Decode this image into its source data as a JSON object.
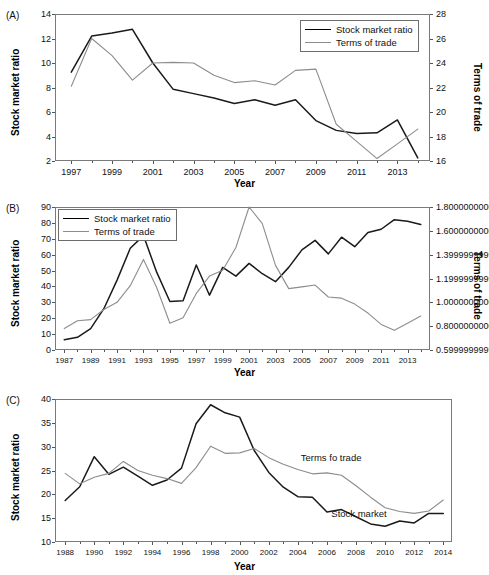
{
  "figure": {
    "panels": [
      {
        "tag": "(A)"
      },
      {
        "tag": "(B)"
      },
      {
        "tag": "(C)"
      }
    ]
  },
  "labels": {
    "stock_market_ratio": "Stock market ratio",
    "terms_of_trade": "Terms of trade",
    "terms_fo_trade": "Terms fo trade",
    "stock_market": "Stock market",
    "year": "Year"
  },
  "colors": {
    "stock_line": "#1a1a1a",
    "terms_line": "#8d8d8d",
    "axis": "#7a7a7a",
    "text": "#111111"
  },
  "chart_data": [
    {
      "type": "line",
      "panel": "A",
      "title": "",
      "xlabel": "Year",
      "ylabel": "Stock market ratio",
      "y2label": "Terms of trade",
      "xlim": [
        1996.2,
        2014.6
      ],
      "ylim": [
        2,
        14
      ],
      "y2lim": [
        16,
        28
      ],
      "yticks": [
        2,
        4,
        6,
        8,
        10,
        12,
        14
      ],
      "y2ticks": [
        16,
        18,
        20,
        22,
        24,
        26,
        28
      ],
      "xticks": [
        1997,
        1999,
        2001,
        2003,
        2005,
        2007,
        2009,
        2011,
        2013
      ],
      "xticks_minor": [
        1998,
        2000,
        2002,
        2004,
        2006,
        2008,
        2010,
        2012,
        2014
      ],
      "grid": false,
      "legend_position": "top-right",
      "x": [
        1997,
        1998,
        1999,
        2000,
        2001,
        2002,
        2003,
        2004,
        2005,
        2006,
        2007,
        2008,
        2009,
        2010,
        2011,
        2012,
        2013,
        2014
      ],
      "series": [
        {
          "name": "Stock market ratio",
          "axis": "left",
          "color": "#1a1a1a",
          "values": [
            9.25,
            12.2,
            12.45,
            12.75,
            10.0,
            7.85,
            7.5,
            7.15,
            6.7,
            7.0,
            6.55,
            7.0,
            5.3,
            4.5,
            4.25,
            4.3,
            5.35,
            2.25
          ]
        },
        {
          "name": "Terms of trade",
          "axis": "right",
          "color": "#8d8d8d",
          "values": [
            22.1,
            26.0,
            24.6,
            22.6,
            24.0,
            24.05,
            24.0,
            23.0,
            22.4,
            22.55,
            22.2,
            23.4,
            23.5,
            19.0,
            17.6,
            16.2,
            17.4,
            18.6
          ]
        }
      ]
    },
    {
      "type": "line",
      "panel": "B",
      "title": "",
      "xlabel": "Year",
      "ylabel": "Stock market ratio",
      "y2label": "Terms of trade",
      "xlim": [
        1986.3,
        2014.7
      ],
      "ylim": [
        0,
        90
      ],
      "y2lim": [
        0.6,
        1.8
      ],
      "yticks": [
        0,
        10,
        20,
        30,
        40,
        50,
        60,
        70,
        80,
        90
      ],
      "y2ticks": [
        0.6,
        0.8,
        1.0,
        1.2,
        1.4,
        1.6,
        1.8
      ],
      "xticks": [
        1987,
        1989,
        1991,
        1993,
        1995,
        1997,
        1999,
        2001,
        2003,
        2005,
        2007,
        2009,
        2011,
        2013
      ],
      "xticks_minor": [
        1988,
        1990,
        1992,
        1994,
        1996,
        1998,
        2000,
        2002,
        2004,
        2006,
        2008,
        2010,
        2012,
        2014
      ],
      "grid": false,
      "legend_position": "top-left",
      "x": [
        1987,
        1988,
        1989,
        1990,
        1991,
        1992,
        1993,
        1994,
        1995,
        1996,
        1997,
        1998,
        1999,
        2000,
        2001,
        2002,
        2003,
        2004,
        2005,
        2006,
        2007,
        2008,
        2009,
        2010,
        2011,
        2012,
        2013,
        2014
      ],
      "series": [
        {
          "name": "Stock market ratio",
          "axis": "left",
          "color": "#1a1a1a",
          "values": [
            6.5,
            8.0,
            13.5,
            26.0,
            44.0,
            64.0,
            72.0,
            49.0,
            30.5,
            31.0,
            53.5,
            34.5,
            52.0,
            46.5,
            54.5,
            48.0,
            43.0,
            52.0,
            63.0,
            69.0,
            60.5,
            71.0,
            65.0,
            74.0,
            76.0,
            82.0,
            81.0,
            79.0
          ]
        },
        {
          "name": "Terms of trade",
          "axis": "right",
          "color": "#8d8d8d",
          "values": [
            0.78,
            0.845,
            0.855,
            0.94,
            1.0,
            1.14,
            1.36,
            1.125,
            0.825,
            0.87,
            1.075,
            1.22,
            1.27,
            1.46,
            1.8,
            1.66,
            1.31,
            1.115,
            1.13,
            1.145,
            1.045,
            1.035,
            0.985,
            0.91,
            0.815,
            0.765,
            0.825,
            0.885
          ]
        }
      ]
    },
    {
      "type": "line",
      "panel": "C",
      "title": "",
      "xlabel": "Year",
      "ylabel": "Stock market ratio",
      "xlim": [
        1987.3,
        2014.6
      ],
      "ylim": [
        10,
        40
      ],
      "yticks": [
        10,
        15,
        20,
        25,
        30,
        35,
        40
      ],
      "xticks": [
        1988,
        1990,
        1992,
        1994,
        1996,
        1998,
        2000,
        2002,
        2004,
        2006,
        2008,
        2010,
        2012,
        2014
      ],
      "xticks_minor": [
        1989,
        1991,
        1993,
        1995,
        1997,
        1999,
        2001,
        2003,
        2005,
        2007,
        2009,
        2011,
        2013
      ],
      "grid": false,
      "legend_position": "inline-annotations",
      "annotations": [
        {
          "text": "Terms fo trade",
          "x": 2004.2,
          "y": 27.4
        },
        {
          "text": "Stock market",
          "x": 2006.3,
          "y": 15.6
        }
      ],
      "x": [
        1988,
        1989,
        1990,
        1991,
        1992,
        1993,
        1994,
        1995,
        1996,
        1997,
        1998,
        1999,
        2000,
        2001,
        2002,
        2003,
        2004,
        2005,
        2006,
        2007,
        2008,
        2009,
        2010,
        2011,
        2012,
        2013,
        2014
      ],
      "series": [
        {
          "name": "Stock market",
          "axis": "left",
          "color": "#1a1a1a",
          "values": [
            18.7,
            21.6,
            27.9,
            24.2,
            25.7,
            23.8,
            21.9,
            23.0,
            25.5,
            34.8,
            38.8,
            37.1,
            36.2,
            29.2,
            24.6,
            21.5,
            19.5,
            19.4,
            16.3,
            16.8,
            15.3,
            13.8,
            13.3,
            14.4,
            14.0,
            16.0,
            16.0
          ]
        },
        {
          "name": "Terms fo trade",
          "axis": "left",
          "color": "#8d8d8d",
          "values": [
            24.4,
            22.2,
            23.6,
            24.4,
            26.9,
            25.0,
            24.0,
            23.3,
            22.3,
            25.6,
            30.1,
            28.6,
            28.7,
            29.6,
            27.7,
            26.3,
            25.2,
            24.3,
            24.5,
            24.0,
            21.8,
            19.4,
            17.2,
            16.4,
            16.0,
            16.5,
            18.8
          ]
        }
      ]
    }
  ]
}
